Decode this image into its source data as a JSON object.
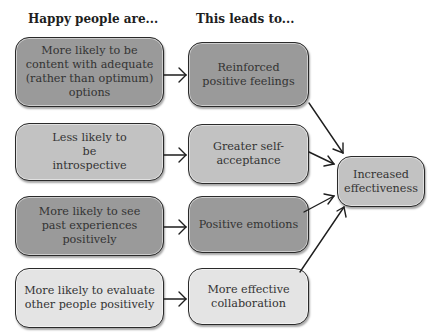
{
  "headers": {
    "left": "Happy people are...",
    "middle": "This leads to..."
  },
  "left_boxes": [
    {
      "text": "More likely to be content with adequate (rather than optimum) options",
      "shade": "#9a9a9a"
    },
    {
      "text": "Less likely to be introspective",
      "shade": "#c2c2c2"
    },
    {
      "text": "More likely to see past experiences positively",
      "shade": "#9a9a9a"
    },
    {
      "text": "More likely to evaluate other people positively",
      "shade": "#e4e4e4"
    }
  ],
  "middle_boxes": [
    {
      "text": "Reinforced positive feelings",
      "shade": "#9a9a9a"
    },
    {
      "text": "Greater self-acceptance",
      "shade": "#c2c2c2"
    },
    {
      "text": "Positive emotions",
      "shade": "#9a9a9a"
    },
    {
      "text": "More effective collaboration",
      "shade": "#e4e4e4"
    }
  ],
  "outcome_box": {
    "text": "Increased effectiveness",
    "shade": "#c2c2c2"
  }
}
